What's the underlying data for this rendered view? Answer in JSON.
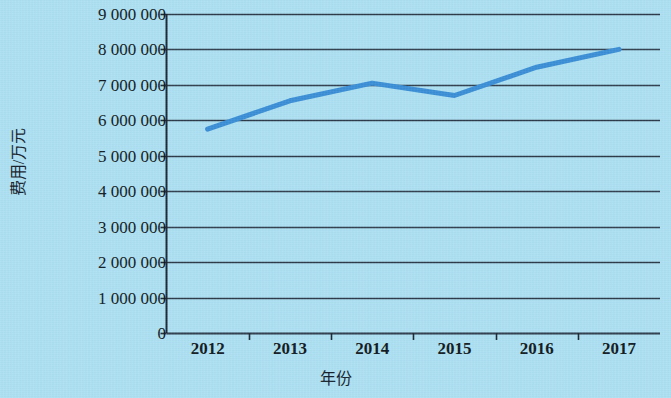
{
  "chart_data": {
    "type": "line",
    "title": "",
    "xlabel": "年份",
    "ylabel": "费用/万元",
    "categories": [
      "2012",
      "2013",
      "2014",
      "2015",
      "2016",
      "2017"
    ],
    "series": [
      {
        "name": "费用",
        "values": [
          5750000,
          6550000,
          7050000,
          6700000,
          7500000,
          8000000
        ],
        "color": "#3a8ed6"
      }
    ],
    "ylim": [
      0,
      9000000
    ],
    "ytick_values": [
      0,
      1000000,
      2000000,
      3000000,
      4000000,
      5000000,
      6000000,
      7000000,
      8000000,
      9000000
    ],
    "ytick_labels": [
      "0",
      "1 000 000",
      "2 000 000",
      "3 000 000",
      "4 000 000",
      "5 000 000",
      "6 000 000",
      "7 000 000",
      "8 000 000",
      "9 000 000"
    ],
    "grid": true,
    "grid_axis": "y",
    "legend": false,
    "legend_position": "none",
    "background_color": "#ace0f2",
    "grid_color": "#2d3b4a",
    "axis_color": "#1b2733"
  },
  "axes": {
    "y_title": "费用/万元",
    "x_title": "年份"
  }
}
